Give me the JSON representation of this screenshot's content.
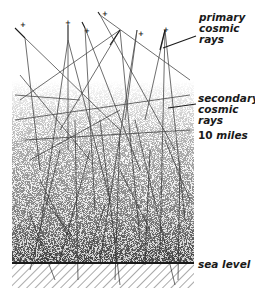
{
  "diagram": {
    "labels": {
      "primary": [
        "primary",
        "cosmic",
        "rays"
      ],
      "secondary": [
        "secondary",
        "cosmic",
        "rays"
      ],
      "altitude_number": "10",
      "altitude_unit": "miles",
      "sea_level": "sea level"
    },
    "colors": {
      "ink": "#1a1a1a",
      "background": "#ffffff",
      "hatch": "#555555"
    }
  }
}
